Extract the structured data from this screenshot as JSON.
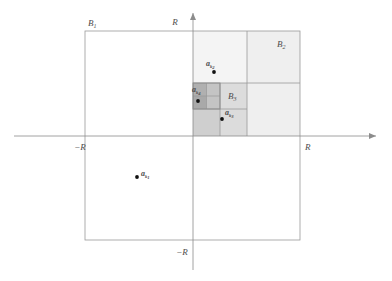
{
  "figure": {
    "type": "geometric-diagram",
    "colors": {
      "axis": "#8c8c8c",
      "square_outline": "#9a9a9a",
      "shade_light": "#efefef",
      "shade_medium": "#dcdcdc",
      "shade_dark": "#c4c4c4",
      "shade_darker": "#b0b0b0",
      "point": "#111111",
      "label": "#4d4d4d"
    },
    "axes": {
      "x_axis_label_right": "R",
      "x_axis_label_left": "−R",
      "y_axis_label_top": "R",
      "y_axis_label_bottom": "−R",
      "x_arrow": "arrow-right",
      "y_arrow": "arrow-up"
    },
    "regions": [
      {
        "id": "B1",
        "label": "B",
        "sub": "1",
        "position": "outer-square-top-left-corner"
      },
      {
        "id": "B2",
        "label": "B",
        "sub": "2",
        "position": "top-right-quadrant"
      },
      {
        "id": "B3",
        "label": "B",
        "sub": "3",
        "position": "nested-quarter-square"
      }
    ],
    "points": [
      {
        "id": "ak1",
        "label": "a",
        "sub": "k",
        "subsub": "1",
        "quadrant": "third",
        "x": 137,
        "y": 177
      },
      {
        "id": "ak2",
        "label": "a",
        "sub": "k",
        "subsub": "2",
        "quadrant": "first-upper",
        "x": 214,
        "y": 72
      },
      {
        "id": "ak3",
        "label": "a",
        "sub": "k",
        "subsub": "3",
        "quadrant": "first-lower",
        "x": 222,
        "y": 119
      },
      {
        "id": "ak4",
        "label": "a",
        "sub": "k",
        "subsub": "4",
        "quadrant": "innermost-small-square",
        "x": 195,
        "y": 101
      }
    ],
    "caption": ""
  }
}
